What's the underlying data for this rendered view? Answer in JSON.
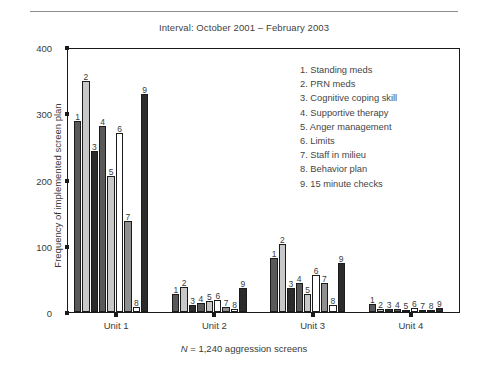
{
  "figure": {
    "title": "Interval: October 2001 – February 2003",
    "caption_italic": "N",
    "caption_rest": " = 1,240 aggression screens"
  },
  "chart_data": {
    "type": "bar",
    "title": "Interval: October 2001 – February 2003",
    "xlabel": "",
    "ylabel": "Frequency of implemented screen plan",
    "ylim": [
      0,
      400
    ],
    "yticks": [
      0,
      100,
      200,
      300,
      400
    ],
    "grid": false,
    "legend_position": "inside-upper-right",
    "categories": [
      "Unit 1",
      "Unit 2",
      "Unit 3",
      "Unit 4"
    ],
    "bar_labels": [
      "1",
      "2",
      "3",
      "4",
      "5",
      "6",
      "7",
      "8",
      "9"
    ],
    "legend": [
      "1. Standing meds",
      "2. PRN meds",
      "3. Cognitive coping skill",
      "4. Supportive therapy",
      "5. Anger management",
      "6. Limits",
      "7. Staff in milieu",
      "8. Behavior plan",
      "9. 15 minute checks"
    ],
    "series": [
      {
        "name": "1. Standing meds",
        "values": [
          290,
          28,
          82,
          12
        ]
      },
      {
        "name": "2. PRN meds",
        "values": [
          352,
          38,
          104,
          4
        ]
      },
      {
        "name": "3. Cognitive coping skill",
        "values": [
          245,
          10,
          36,
          4
        ]
      },
      {
        "name": "4. Supportive therapy",
        "values": [
          283,
          14,
          44,
          5
        ]
      },
      {
        "name": "5. Anger management",
        "values": [
          207,
          16,
          28,
          3
        ]
      },
      {
        "name": "6. Limits",
        "values": [
          273,
          19,
          57,
          6
        ]
      },
      {
        "name": "7. Staff in milieu",
        "values": [
          138,
          7,
          44,
          2
        ]
      },
      {
        "name": "8. Behavior plan",
        "values": [
          8,
          5,
          10,
          2
        ]
      },
      {
        "name": "9. 15 minute checks",
        "values": [
          332,
          37,
          75,
          6
        ]
      }
    ]
  }
}
